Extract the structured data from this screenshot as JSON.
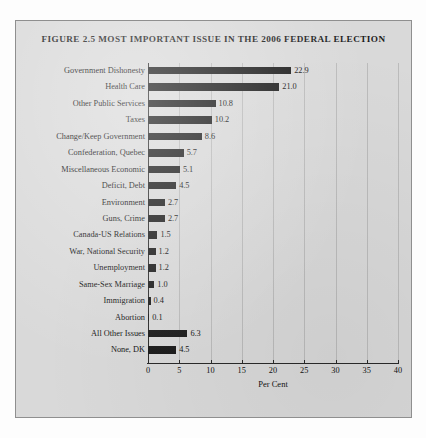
{
  "figure": {
    "title": "Figure 2.5 Most Important Issue in the 2006 Federal Election",
    "panel_background": "#d9d9d9",
    "bar_color": "#1a1a1a",
    "page_background": "#fdfdfd"
  },
  "chart_data": {
    "type": "bar",
    "orientation": "horizontal",
    "title": "Figure 2.5 Most Important Issue in the 2006 Federal Election",
    "xlabel": "Per Cent",
    "ylabel": "",
    "xlim": [
      0,
      40
    ],
    "xticks": [
      0,
      5,
      10,
      15,
      20,
      25,
      30,
      35,
      40
    ],
    "grid": true,
    "grid_axis": "x",
    "legend": null,
    "categories": [
      "Government Dishonesty",
      "Health Care",
      "Other Public Services",
      "Taxes",
      "Change/Keep Government",
      "Confederation, Quebec",
      "Miscellaneous Economic",
      "Deficit, Debt",
      "Environment",
      "Guns, Crime",
      "Canada-US Relations",
      "War, National Security",
      "Unemployment",
      "Same-Sex Marriage",
      "Immigration",
      "Abortion",
      "All Other Issues",
      "None, DK"
    ],
    "values": [
      22.9,
      21.0,
      10.8,
      10.2,
      8.6,
      5.7,
      5.1,
      4.5,
      2.7,
      2.7,
      1.5,
      1.2,
      1.2,
      1.0,
      0.4,
      0.1,
      6.3,
      4.5
    ],
    "value_labels": [
      "22.9",
      "21.0",
      "10.8",
      "10.2",
      "8.6",
      "5.7",
      "5.1",
      "4.5",
      "2.7",
      "2.7",
      "1.5",
      "1.2",
      "1.2",
      "1.0",
      "0.4",
      "0.1",
      "6.3",
      "4.5"
    ]
  }
}
